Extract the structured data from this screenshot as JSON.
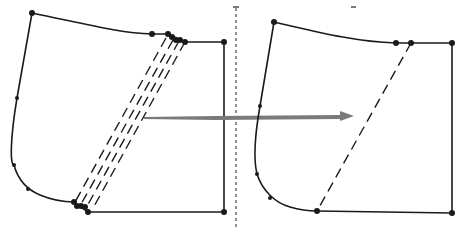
{
  "diagram": {
    "type": "pattern-transformation",
    "colors": {
      "outline": "#1a1a1a",
      "arrow": "#7a7a7a",
      "divider": "#222222",
      "background": "#ffffff"
    },
    "left_panel": {
      "slash_line_count": 4,
      "label": ""
    },
    "right_panel": {
      "slash_line_count": 1,
      "label": ""
    }
  }
}
